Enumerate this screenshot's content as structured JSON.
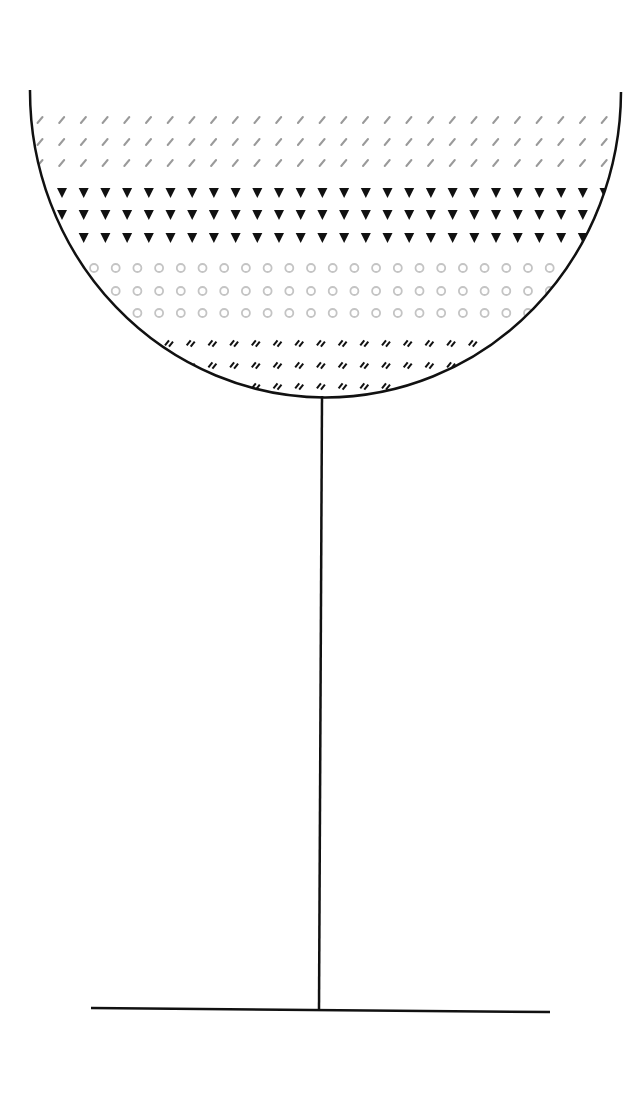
{
  "diagram": {
    "type": "layered-goblet",
    "background": "#ffffff",
    "outline_color": "#111111",
    "bowl": {
      "shape": "semicircle",
      "left_top": [
        30,
        90
      ],
      "right_top": [
        621,
        92
      ],
      "bottom": [
        322,
        395
      ],
      "center": [
        325,
        90
      ],
      "radius_x": 294,
      "radius_y": 305,
      "stroke_width": 2.5
    },
    "stem": {
      "top": [
        322,
        396
      ],
      "bottom": [
        319,
        1010
      ],
      "stroke_width": 2.5
    },
    "base": {
      "left": [
        91,
        1008
      ],
      "right": [
        550,
        1012
      ],
      "stroke_width": 2.5
    },
    "layers": [
      {
        "name": "grey-slash-layer",
        "pattern": "slash",
        "color": "#9a9a9a",
        "rows_y": [
          120,
          142,
          163
        ],
        "x_start": 40,
        "x_step": 21.7
      },
      {
        "name": "black-triangle-layer",
        "pattern": "triangle-down",
        "color": "#111111",
        "rows_y": [
          193,
          215,
          238
        ],
        "x_start": 62,
        "x_step": 21.7
      },
      {
        "name": "grey-circle-layer",
        "pattern": "circle",
        "color": "#c4c4c4",
        "rows_y": [
          268,
          291,
          313
        ],
        "x_start": 94,
        "x_step": 21.7
      },
      {
        "name": "black-double-dash-layer",
        "pattern": "double-dash",
        "color": "#111111",
        "rows_y": [
          343,
          365,
          386
        ],
        "x_start": 170,
        "x_step": 21.7
      }
    ]
  }
}
